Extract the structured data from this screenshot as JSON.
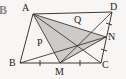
{
  "figure": {
    "tag": "B",
    "caption": "Parallelogram ABCD with midpoints M on BC and N on DC; shaded triangle AMN",
    "background_color": "#f7f6f4",
    "stroke_color": "#3a3a3a",
    "shade_color": "#c9c8c6",
    "label_color": "#1b1b1b",
    "width": 126,
    "height": 79
  },
  "points": {
    "A": {
      "label": "A",
      "x": 33,
      "y": 14,
      "label_x": 22,
      "label_y": 3
    },
    "D": {
      "label": "D",
      "x": 112,
      "y": 12,
      "label_x": 110,
      "label_y": 2
    },
    "B": {
      "label": "B",
      "x": 20,
      "y": 63,
      "label_x": 9,
      "label_y": 58
    },
    "C": {
      "label": "C",
      "x": 101,
      "y": 63,
      "label_x": 102,
      "label_y": 60
    },
    "M": {
      "label": "M",
      "x": 60,
      "y": 63,
      "label_x": 55,
      "label_y": 67
    },
    "N": {
      "label": "N",
      "x": 106,
      "y": 37,
      "label_x": 108,
      "label_y": 32
    },
    "P": {
      "label": "P",
      "x": 45,
      "y": 43,
      "label_x": 37,
      "label_y": 38
    },
    "Q": {
      "label": "Q",
      "x": 79,
      "y": 27,
      "label_x": 74,
      "label_y": 15
    }
  },
  "segments": [
    {
      "name": "side-AD",
      "from": "A",
      "to": "D",
      "kind": "boundary"
    },
    {
      "name": "side-DC",
      "from": "D",
      "to": "C",
      "kind": "boundary"
    },
    {
      "name": "side-BC",
      "from": "B",
      "to": "C",
      "kind": "boundary"
    },
    {
      "name": "side-AB",
      "from": "A",
      "to": "B",
      "kind": "boundary"
    },
    {
      "name": "line-AM",
      "from": "A",
      "to": "M",
      "kind": "cevian"
    },
    {
      "name": "line-AN",
      "from": "A",
      "to": "N",
      "kind": "cevian"
    },
    {
      "name": "line-AC",
      "from": "A",
      "to": "C",
      "kind": "cevian"
    },
    {
      "name": "line-MN",
      "from": "M",
      "to": "N",
      "kind": "cevian"
    },
    {
      "name": "line-MD",
      "from": "M",
      "to": "D",
      "kind": "cevian"
    },
    {
      "name": "line-BN",
      "from": "B",
      "to": "N",
      "kind": "cevian"
    }
  ],
  "shaded_region": {
    "name": "triangle-AMN",
    "vertices": [
      "A",
      "M",
      "N"
    ]
  },
  "tick_marks": [
    {
      "name": "tick-BM",
      "on_segment": "BM",
      "x": 40,
      "y": 63,
      "orientation": "vertical"
    },
    {
      "name": "tick-MC",
      "on_segment": "MC",
      "x": 80,
      "y": 63,
      "orientation": "vertical"
    },
    {
      "name": "tick-DN",
      "on_segment": "DN",
      "x": 109,
      "y": 24,
      "orientation": "perpendicular"
    },
    {
      "name": "tick-NC",
      "on_segment": "NC",
      "x": 104,
      "y": 50,
      "orientation": "perpendicular"
    }
  ]
}
